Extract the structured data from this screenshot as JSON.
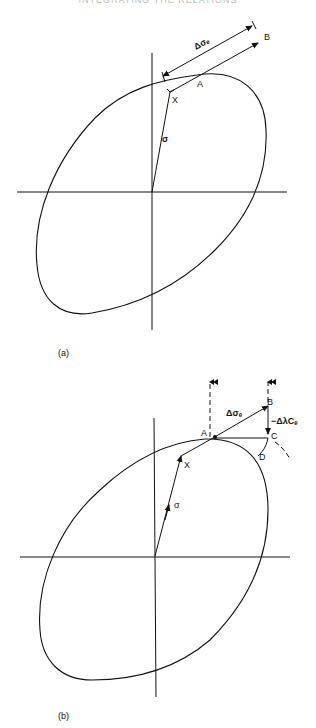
{
  "header": {
    "text": "INTEGRATING THE RELATIONS"
  },
  "figure_a": {
    "caption": "(a)",
    "labels": {
      "delta_sigma_e": "Δσₑ",
      "point_a": "A",
      "point_b": "B",
      "point_x": "X",
      "sigma": "σ"
    }
  },
  "figure_b": {
    "caption": "(b)",
    "labels": {
      "delta_sigma_e": "Δσₑ",
      "point_a": "A",
      "point_b": "B",
      "point_c": "C",
      "point_d": "D",
      "point_x": "X",
      "sigma": "σ",
      "correction": "−ΔλCₑ"
    }
  },
  "colors": {
    "ink": "#111111",
    "background": "#ffffff"
  }
}
